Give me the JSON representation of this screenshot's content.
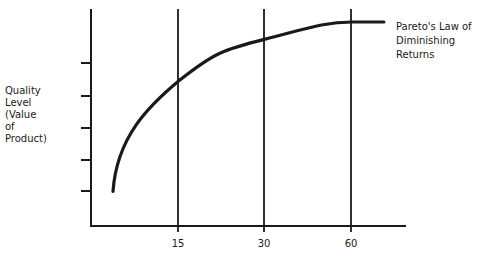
{
  "chart_data": {
    "type": "line",
    "title": "",
    "ylabel_lines": [
      "Quality",
      "Level",
      "(Value",
      "of",
      "Product)"
    ],
    "xlabel": "",
    "x_ticks": [
      "15",
      "30",
      "60"
    ],
    "y_tick_count": 5,
    "y_tick_labels": [],
    "annotation_lines": [
      "Pareto's Law of",
      "Diminishing",
      "Returns"
    ],
    "curve": {
      "name": "Pareto's Law of Diminishing Returns",
      "shape": "concave-increasing (diminishing returns)",
      "points_relative": [
        {
          "x_frac": 0.07,
          "y_frac": 0.16
        },
        {
          "x_frac": 0.28,
          "y_frac": 0.67
        },
        {
          "x_frac": 0.55,
          "y_frac": 0.86
        },
        {
          "x_frac": 0.83,
          "y_frac": 0.94
        },
        {
          "x_frac": 0.93,
          "y_frac": 0.94
        }
      ]
    },
    "vertical_reference_lines": [
      "15",
      "30",
      "60"
    ],
    "grid": false,
    "legend": "none"
  }
}
